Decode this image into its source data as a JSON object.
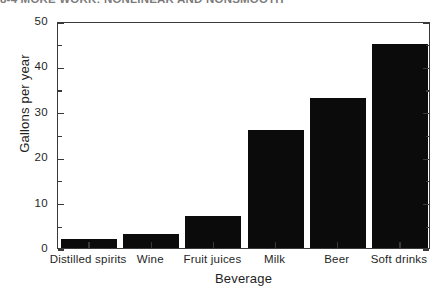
{
  "page": {
    "running_head": "8-4  MORE WORK: NONLINEAR AND NONSMOOTH"
  },
  "chart_data": {
    "type": "bar",
    "title": "",
    "subtitle": "",
    "categories": [
      "Distilled spirits",
      "Wine",
      "Fruit juices",
      "Milk",
      "Beer",
      "Soft drinks"
    ],
    "values": [
      2,
      3,
      7,
      26,
      33,
      45
    ],
    "xlabel": "Beverage",
    "ylabel": "Gallons per year",
    "ylim": [
      0,
      50
    ],
    "ytick_labels": [
      "0",
      "10",
      "20",
      "30",
      "40",
      "50"
    ],
    "ytick_values": [
      0,
      10,
      20,
      30,
      40,
      50
    ],
    "yminor_interval": 5,
    "grid": false,
    "legend": false,
    "bar_color": "#0b0b0b",
    "axis_color": "#3a3a3a",
    "background": "#ffffff"
  }
}
